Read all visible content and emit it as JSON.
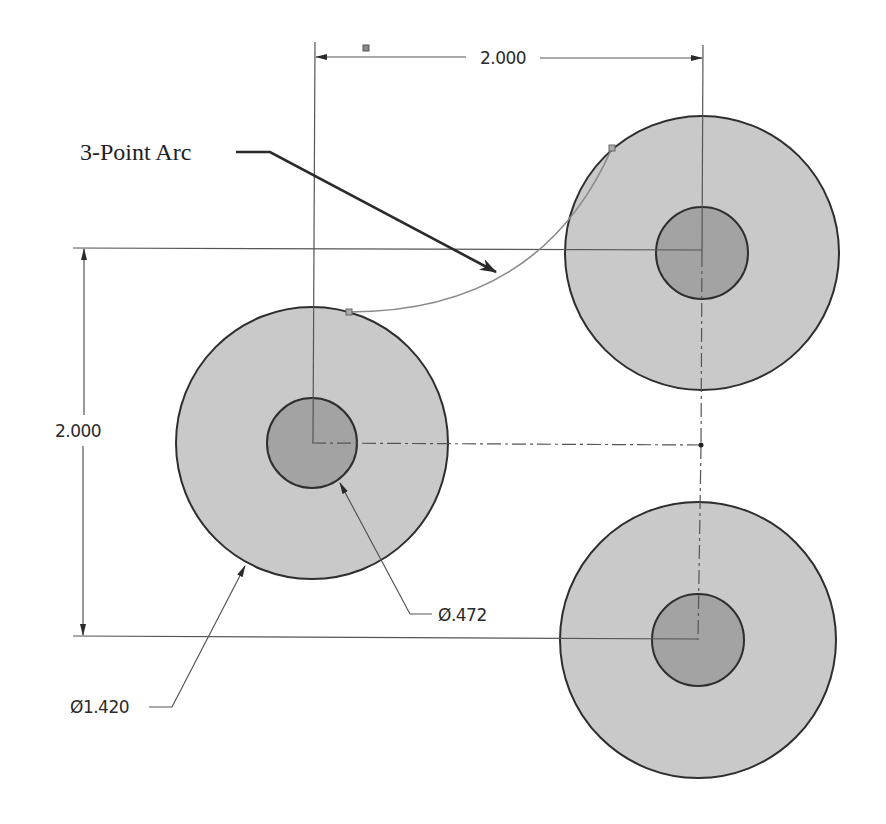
{
  "drawing": {
    "colors": {
      "outer_fill": "#c9c9c9",
      "inner_fill": "#a3a3a3",
      "outline": "#2e2e2e",
      "arc": "#8a8a8a"
    },
    "circles": [
      {
        "name": "left",
        "cx": 312,
        "cy": 443,
        "outer_r": 136,
        "inner_r": 45
      },
      {
        "name": "top-right",
        "cx": 702,
        "cy": 253,
        "outer_r": 137,
        "inner_r": 46
      },
      {
        "name": "bottom-right",
        "cx": 698,
        "cy": 640,
        "outer_r": 138,
        "inner_r": 46
      }
    ],
    "annotations": {
      "arc_label": "3-Point Arc",
      "horizontal_dimension": "2.000",
      "vertical_dimension": "2.000",
      "outer_diameter": "Ø1.420",
      "inner_diameter": "Ø.472"
    }
  }
}
